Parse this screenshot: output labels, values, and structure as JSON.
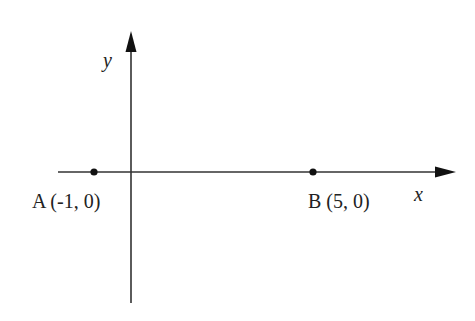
{
  "diagram": {
    "type": "coordinate-plane",
    "colors": {
      "axis": "#333333",
      "point": "#111111",
      "text": "#222222",
      "background": "#ffffff"
    },
    "axes": {
      "x": {
        "label": "x"
      },
      "y": {
        "label": "y"
      }
    },
    "points": [
      {
        "name": "A",
        "label": "A (-1, 0)",
        "x": -1,
        "y": 0
      },
      {
        "name": "B",
        "label": "B (5, 0)",
        "x": 5,
        "y": 0
      }
    ]
  }
}
